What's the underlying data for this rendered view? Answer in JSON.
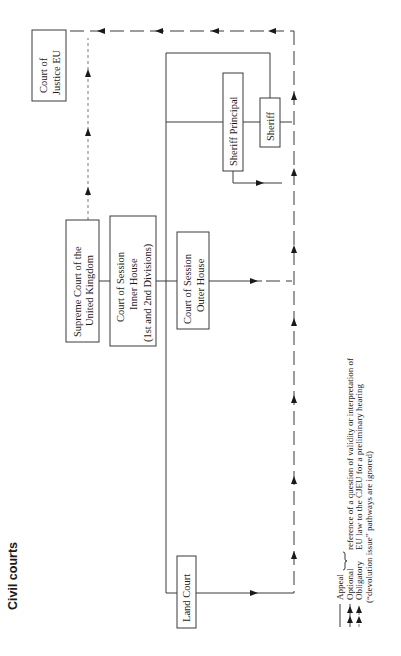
{
  "title": "Civil courts",
  "colors": {
    "ink": "#1a1a1a",
    "line": "#3a3a3a",
    "background": "#ffffff"
  },
  "orientation": "rotated 90 degrees counter-clockwise",
  "courts": {
    "cjeu": {
      "line1": "Court of",
      "line2": "Justice EU"
    },
    "supreme": {
      "line1": "Supreme Court of the",
      "line2": "United Kingdom"
    },
    "inner_house": {
      "line1": "Court of Session",
      "line2": "Inner House",
      "line3": "(1st and 2nd Divisions)"
    },
    "outer_house": {
      "line1": "Court of Session",
      "line2": "Outer House"
    },
    "sheriff_principal": {
      "label": "Sheriff Principal"
    },
    "sheriff": {
      "label": "Sheriff"
    },
    "land_court": {
      "label": "Land Court"
    }
  },
  "legend": {
    "items": [
      {
        "line_style": "solid",
        "arrow": "none",
        "label": "Appeal"
      },
      {
        "line_style": "solid",
        "arrow": "double",
        "label": "Optional"
      },
      {
        "line_style": "dashed",
        "arrow": "double",
        "label": "Obligatory"
      }
    ],
    "bracket_note_line1": "reference of a question of validity or interpretation of",
    "bracket_note_line2": "EU law to the CJEU for a preliminary hearing",
    "footnote": "(“devolution issue” pathways are ignored)"
  }
}
